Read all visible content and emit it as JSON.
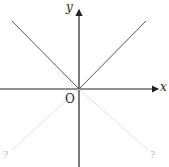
{
  "diagram": {
    "axes": {
      "x_label": "x",
      "y_label": "y",
      "origin_label": "O"
    },
    "lines": [
      {
        "name": "upper-left",
        "style": "solid"
      },
      {
        "name": "upper-right",
        "style": "solid"
      },
      {
        "name": "lower-left",
        "style": "faint"
      },
      {
        "name": "lower-right",
        "style": "faint"
      }
    ],
    "unknown_labels": [
      "?",
      "?"
    ],
    "colors": {
      "axis": "#222222",
      "solid_line": "#444444",
      "faint_line": "#dddddd",
      "faint_label": "#bbbbbb"
    }
  }
}
